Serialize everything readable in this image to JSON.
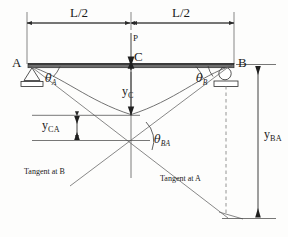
{
  "figure": {
    "type": "structural-beam-deflection-diagram",
    "background_color": "#fdfdfc",
    "line_color": "#3a3a3a",
    "beam_color": "#555555"
  },
  "dimensions": {
    "left_span_label": "L/2",
    "right_span_label": "L/2"
  },
  "nodes": {
    "support_a_label": "A",
    "support_b_label": "B",
    "midspan_label": "C",
    "support_a_type": "pin-support",
    "support_b_type": "roller-support"
  },
  "load": {
    "label": "P",
    "direction": "downward",
    "location": "midspan"
  },
  "angles": {
    "theta_a": {
      "base": "θ",
      "sub": "A"
    },
    "theta_b": {
      "base": "θ",
      "sub": "B"
    },
    "theta_ba": {
      "base": "θ",
      "sub": "BA"
    }
  },
  "deflections": {
    "y_c": {
      "base": "y",
      "sub": "C"
    },
    "y_ca": {
      "base": "y",
      "sub": "CA"
    },
    "y_ba": {
      "base": "y",
      "sub": "BA"
    }
  },
  "tangents": {
    "tangent_at_b": "Tangent at B",
    "tangent_at_a": "Tangent at A"
  }
}
